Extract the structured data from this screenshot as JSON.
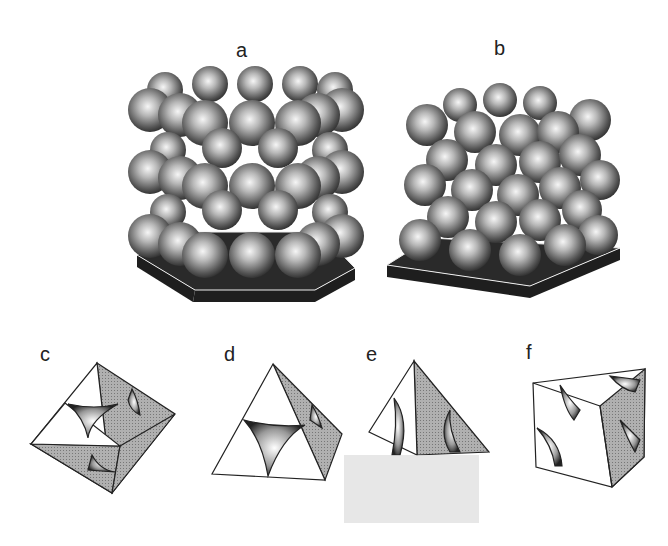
{
  "figure": {
    "panels": [
      {
        "id": "a",
        "label": "a",
        "description": "Hexagonal close packing of spheres (ABAB layers) on a hexagonal base"
      },
      {
        "id": "b",
        "label": "b",
        "description": "Cubic close packing of spheres (ABCABC layers) on a square base"
      },
      {
        "id": "c",
        "label": "c",
        "description": "Octahedral hole"
      },
      {
        "id": "d",
        "label": "d",
        "description": "Tetrahedral hole"
      },
      {
        "id": "e",
        "label": "e",
        "description": "Tetrahedral/octahedral hole geometry"
      },
      {
        "id": "f",
        "label": "f",
        "description": "Cubic cell with hole"
      }
    ]
  },
  "colors": {
    "sphere_light": "#f4f4f4",
    "sphere_mid": "#9a9a9a",
    "sphere_dark": "#3a3a3a",
    "base": "#1e1e1e",
    "face_shade": "#a8a8a8",
    "line": "#222222"
  }
}
